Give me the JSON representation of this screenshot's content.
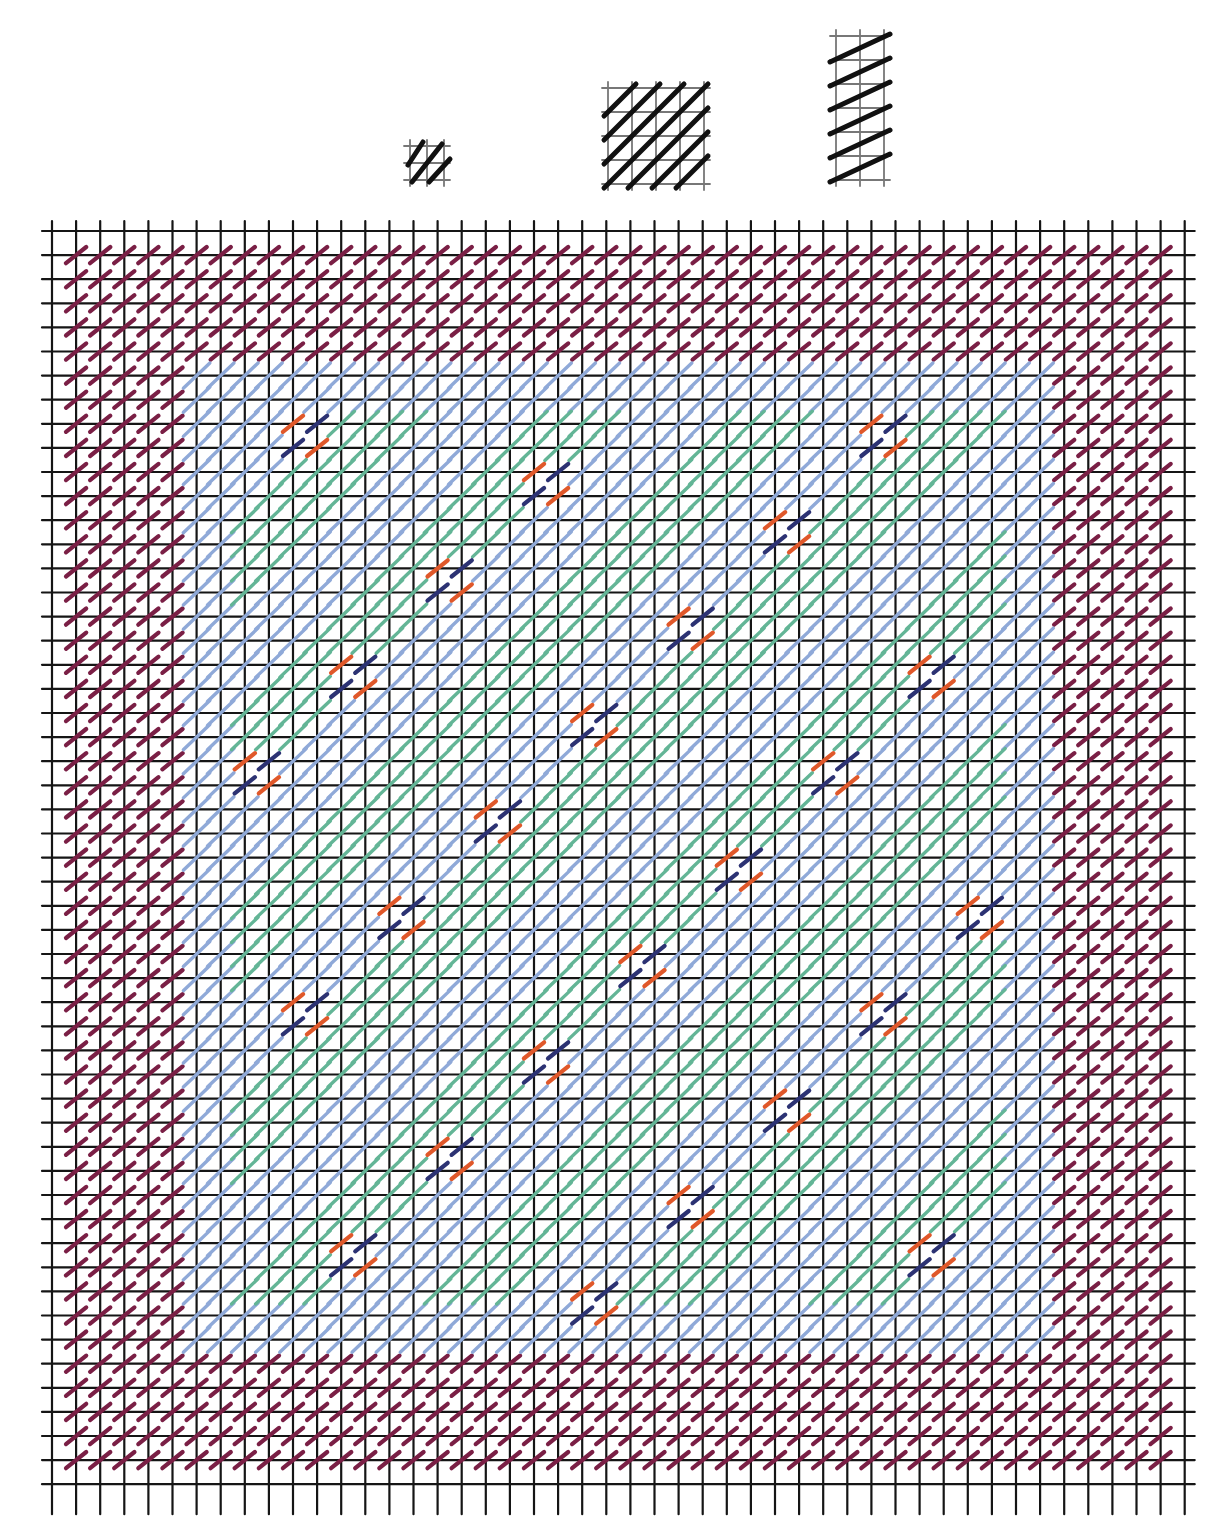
{
  "diagram": {
    "type": "needlepoint-stitch-chart",
    "colors": {
      "grid": "#151515",
      "border_tent": "#7a1f45",
      "frame_blue": "#8fa9d8",
      "field_teal": "#63b596",
      "accent_orange": "#e0582a",
      "accent_navy": "#2c3273",
      "sample_ink": "#111111",
      "sample_grid": "#777777"
    },
    "grid": {
      "origin_x": 52,
      "origin_y": 231,
      "pitch": 24.1,
      "columns": 48,
      "rows": 53,
      "overhang": 10
    },
    "regions": {
      "inner_col_start": 6,
      "inner_col_end": 41,
      "inner_row_start": 6,
      "inner_row_end": 46,
      "border_cells": 1
    },
    "pattern": {
      "repeat": 8,
      "accent_motifs": "2x2 orange/navy tent-stitch blocks on diagonals"
    },
    "samples": [
      {
        "name": "tent-stitch-sample",
        "x": 410,
        "y": 146,
        "cols": 2,
        "rows": 2,
        "pitch": 17,
        "kind": "small"
      },
      {
        "name": "diagonal-block-sample",
        "x": 608,
        "y": 88,
        "cols": 4,
        "rows": 4,
        "pitch": 24,
        "kind": "block"
      },
      {
        "name": "column-sample",
        "x": 836,
        "y": 36,
        "cols": 2,
        "rows": 6,
        "pitch": 24,
        "kind": "column"
      }
    ]
  }
}
